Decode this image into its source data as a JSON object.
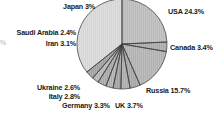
{
  "figure": {
    "background_color": "#ffffff",
    "width": 216,
    "height": 119
  },
  "edge_fragment": {
    "text": "%"
  },
  "chart_data": {
    "type": "pie",
    "title": "",
    "subtitle": "",
    "xlabel": "",
    "ylabel": "",
    "grid": false,
    "legend_position": "none",
    "label_format": "name value%",
    "start_angle_deg": 0,
    "direction": "clockwise",
    "center_px": [
      122,
      44
    ],
    "radius_px": 45,
    "categories": [
      "USA",
      "Canada",
      "Russia",
      "UK",
      "Germany",
      "Italy",
      "Ukraine",
      "Iran",
      "Saudi Arabia",
      "Japan",
      "Other"
    ],
    "values": [
      24.3,
      3.4,
      15.7,
      3.7,
      3.3,
      2.8,
      2.6,
      3.1,
      2.4,
      3.0,
      35.7
    ],
    "slices": [
      {
        "name": "USA",
        "value": 24.3,
        "label": "USA 24.3%",
        "fill": "#b9b9b9",
        "label_side": "right",
        "label_x": 168,
        "label_y": 8
      },
      {
        "name": "Canada",
        "value": 3.4,
        "label": "Canada 3.4%",
        "fill": "#a8a8a8",
        "label_side": "right",
        "label_x": 170,
        "label_y": 44
      },
      {
        "name": "Russia",
        "value": 15.7,
        "label": "Russia 15.7%",
        "fill": "#b0b0b0",
        "label_side": "right",
        "label_x": 146,
        "label_y": 87
      },
      {
        "name": "UK",
        "value": 3.7,
        "label": "UK 3.7%",
        "fill": "#a4a4a4",
        "label_side": "bottom",
        "label_x": 115,
        "label_y": 102
      },
      {
        "name": "Germany",
        "value": 3.3,
        "label": "Germany 3.3%",
        "fill": "#ababab",
        "label_side": "bottom",
        "label_x": 62,
        "label_y": 102
      },
      {
        "name": "Italy",
        "value": 2.8,
        "label": "Italy 2.8%",
        "fill": "#a0a0a0",
        "label_side": "left",
        "label_x": 80,
        "label_y": 93
      },
      {
        "name": "Ukraine",
        "value": 2.6,
        "label": "Ukraine 2.6%",
        "fill": "#aeaeae",
        "label_side": "left",
        "label_x": 80,
        "label_y": 84
      },
      {
        "name": "Iran",
        "value": 3.1,
        "label": "Iran 3.1%",
        "fill": "#a6a6a6",
        "label_side": "left",
        "label_x": 76,
        "label_y": 40
      },
      {
        "name": "Saudi Arabia",
        "value": 2.4,
        "label": "Saudi Arabia 2.4%",
        "fill": "#b4b4b4",
        "label_side": "left",
        "label_x": 76,
        "label_y": 29
      },
      {
        "name": "Japan",
        "value": 3.0,
        "label": "Japan 3%",
        "fill": "#9e9e9e",
        "label_side": "left",
        "label_x": 95,
        "label_y": 3
      },
      {
        "name": "Other",
        "value": 35.7,
        "label": "",
        "fill": "#d6d6d6",
        "label_side": "none",
        "label_x": 0,
        "label_y": 0
      }
    ]
  }
}
